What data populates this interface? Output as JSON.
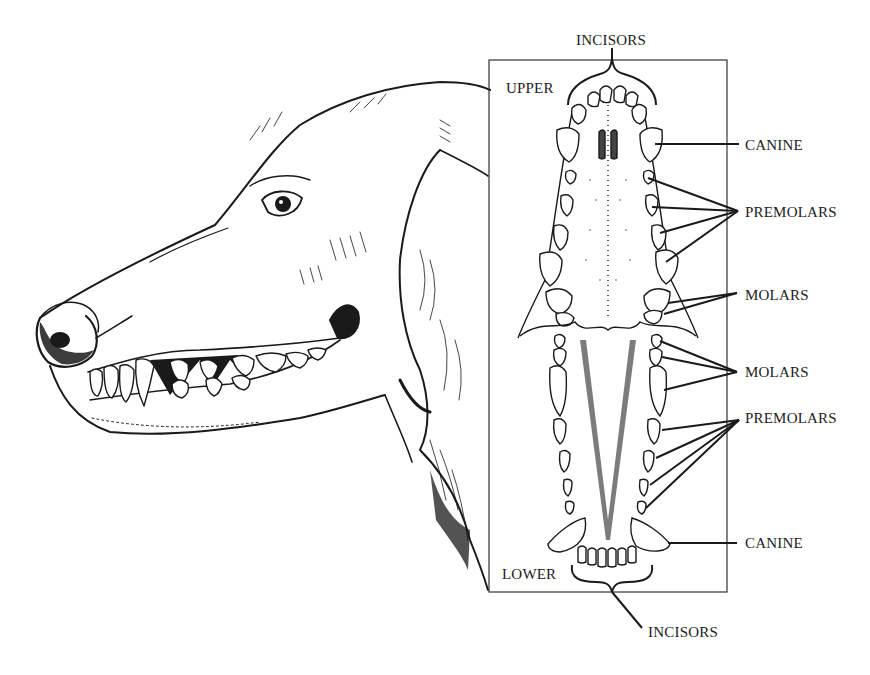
{
  "diagram": {
    "labels": {
      "incisors_top": "INCISORS",
      "upper": "UPPER",
      "canine_upper": "CANINE",
      "premolars_upper": "PREMOLARS",
      "molars_upper": "MOLARS",
      "molars_lower": "MOLARS",
      "premolars_lower": "PREMOLARS",
      "canine_lower": "CANINE",
      "lower": "LOWER",
      "incisors_bottom": "INCISORS"
    }
  }
}
